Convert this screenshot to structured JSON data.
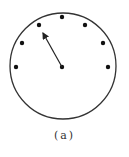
{
  "diagram": {
    "label": "(a)",
    "circle": {
      "cx": 63,
      "cy": 66,
      "r": 53,
      "stroke": "#333333"
    },
    "center_dot": {
      "x": 62,
      "y": 67
    },
    "dots": [
      {
        "x": 62,
        "y": 17
      },
      {
        "x": 85,
        "y": 25
      },
      {
        "x": 103,
        "y": 43
      },
      {
        "x": 108,
        "y": 67
      },
      {
        "x": 39,
        "y": 25
      },
      {
        "x": 22,
        "y": 43
      },
      {
        "x": 16,
        "y": 67
      }
    ],
    "arrow": {
      "from": [
        62,
        67
      ],
      "to": [
        43,
        33
      ]
    }
  }
}
